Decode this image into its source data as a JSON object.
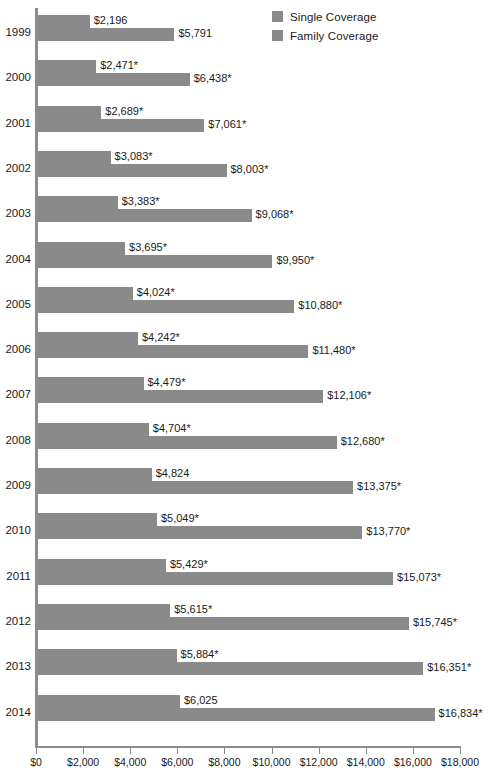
{
  "legend": {
    "items": [
      {
        "label": "Single Coverage",
        "color": "#8a8a8a",
        "name": "legend-single-coverage"
      },
      {
        "label": "Family Coverage",
        "color": "#8a8a8a",
        "name": "legend-family-coverage"
      }
    ]
  },
  "axis": {
    "tick_labels": [
      "$0",
      "$2,000",
      "$4,000",
      "$6,000",
      "$8,000",
      "$10,000",
      "$12,000",
      "$14,000",
      "$16,000",
      "$18,000"
    ],
    "min": 0,
    "max": 18000,
    "step": 2000
  },
  "chart_data": {
    "type": "bar",
    "orientation": "horizontal",
    "title": "",
    "xlabel": "",
    "ylabel": "",
    "xlim": [
      0,
      18000
    ],
    "grid": false,
    "legend_position": "top-right",
    "categories": [
      "1999",
      "2000",
      "2001",
      "2002",
      "2003",
      "2004",
      "2005",
      "2006",
      "2007",
      "2008",
      "2009",
      "2010",
      "2011",
      "2012",
      "2013",
      "2014"
    ],
    "series": [
      {
        "name": "Single Coverage",
        "color": "#8a8a8a",
        "values": [
          2196,
          2471,
          2689,
          3083,
          3383,
          3695,
          4024,
          4242,
          4479,
          4704,
          4824,
          5049,
          5429,
          5615,
          5884,
          6025
        ],
        "labels": [
          "$2,196",
          "$2,471*",
          "$2,689*",
          "$3,083*",
          "$3,383*",
          "$3,695*",
          "$4,024*",
          "$4,242*",
          "$4,479*",
          "$4,704*",
          "$4,824",
          "$5,049*",
          "$5,429*",
          "$5,615*",
          "$5,884*",
          "$6,025"
        ]
      },
      {
        "name": "Family Coverage",
        "color": "#8a8a8a",
        "values": [
          5791,
          6438,
          7061,
          8003,
          9068,
          9950,
          10880,
          11480,
          12106,
          12680,
          13375,
          13770,
          15073,
          15745,
          16351,
          16834
        ],
        "labels": [
          "$5,791",
          "$6,438*",
          "$7,061*",
          "$8,003*",
          "$9,068*",
          "$9,950*",
          "$10,880*",
          "$11,480*",
          "$12,106*",
          "$12,680*",
          "$13,375*",
          "$13,770*",
          "$15,073*",
          "$15,745*",
          "$16,351*",
          "$16,834*"
        ]
      }
    ]
  }
}
